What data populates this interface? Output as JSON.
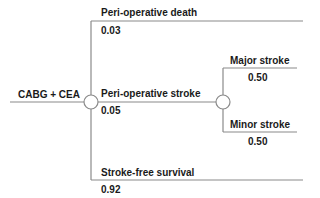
{
  "diagram": {
    "type": "decision-tree",
    "root": {
      "label": "CABG + CEA"
    },
    "branches": [
      {
        "label": "Peri-operative death",
        "probability": "0.03"
      },
      {
        "label": "Peri-operative stroke",
        "probability": "0.05",
        "sub_branches": [
          {
            "label": "Major stroke",
            "probability": "0.50"
          },
          {
            "label": "Minor stroke",
            "probability": "0.50"
          }
        ]
      },
      {
        "label": "Stroke-free survival",
        "probability": "0.92"
      }
    ],
    "colors": {
      "line": "#8a8a8a",
      "text": "#1a1a1a",
      "node_fill": "#ffffff"
    }
  }
}
